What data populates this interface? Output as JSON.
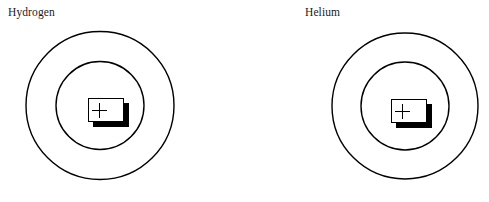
{
  "figure": {
    "type": "diagram",
    "background_color": "#ffffff",
    "stroke_color": "#000000",
    "text_color": "#1a1a1a",
    "width": 489,
    "height": 202
  },
  "atoms": [
    {
      "label": "Hydrogen",
      "label_x": 8,
      "label_y": 6,
      "center_x": 100,
      "center_y": 105.5,
      "outer_shell_radius": 74,
      "inner_shell_radius": 44,
      "nucleus": {
        "charge_symbol": "+",
        "x": 88,
        "y": 98,
        "width": 36,
        "height": 24,
        "shadow_offset_x": 5,
        "shadow_offset_y": 5
      }
    },
    {
      "label": "Helium",
      "label_x": 305,
      "label_y": 6,
      "center_x": 405,
      "center_y": 106,
      "outer_shell_radius": 73,
      "inner_shell_radius": 44,
      "nucleus": {
        "charge_symbol": "+",
        "x": 391,
        "y": 99,
        "width": 36,
        "height": 24,
        "shadow_offset_x": 5,
        "shadow_offset_y": 5
      }
    }
  ]
}
